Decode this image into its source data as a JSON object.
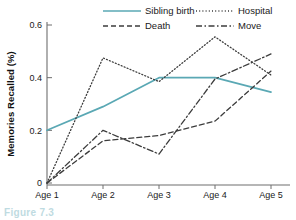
{
  "figure": {
    "caption": "Figure 7.3"
  },
  "chart_data": {
    "type": "line",
    "title": "",
    "xlabel": "",
    "ylabel": "Memories Recalled (%)",
    "categories": [
      "Age 1",
      "Age 2",
      "Age 3",
      "Age 4",
      "Age 5"
    ],
    "yticks": [
      "0",
      "0.2",
      "0.4",
      "0.6"
    ],
    "ytick_values": [
      0,
      0.2,
      0.4,
      0.6
    ],
    "ylim": [
      0,
      0.6
    ],
    "grid": false,
    "legend_position": "top",
    "series": [
      {
        "name": "Sibling birth",
        "values": [
          0.2,
          0.29,
          0.4,
          0.4,
          0.345
        ],
        "color": "#5aa8b4",
        "dash": "solid"
      },
      {
        "name": "Hospital",
        "values": [
          0.0,
          0.475,
          0.385,
          0.555,
          0.41
        ],
        "color": "#3c3c3c",
        "dash": "dotted"
      },
      {
        "name": "Death",
        "values": [
          0.0,
          0.16,
          0.18,
          0.235,
          0.425
        ],
        "color": "#3c3c3c",
        "dash": "dashed"
      },
      {
        "name": "Move",
        "values": [
          0.0,
          0.2,
          0.11,
          0.395,
          0.49
        ],
        "color": "#3c3c3c",
        "dash": "dashdot"
      }
    ]
  }
}
